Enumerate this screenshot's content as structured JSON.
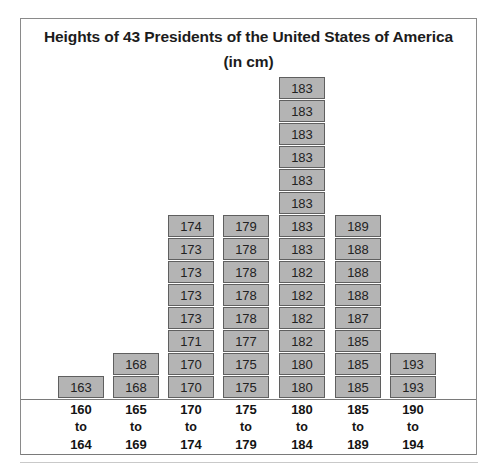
{
  "chart": {
    "title_line1": "Heights of 43 Presidents of the United States of",
    "title_line2": "America (in cm)",
    "connector": "to"
  },
  "chart_data": {
    "type": "bar",
    "title": "Heights of 43 Presidents of the United States of America (in cm)",
    "xlabel": "",
    "ylabel": "",
    "grid": false,
    "legend": "none",
    "note": "Stacked block (stem/dot-plot style) histogram; each block is one president labelled with that president's height in cm.",
    "categories": [
      "160 to 164",
      "165 to 169",
      "170 to 174",
      "175 to 179",
      "180 to 184",
      "185 to 189",
      "190 to 194"
    ],
    "category_lines": [
      {
        "low": "160",
        "mid": "to",
        "high": "164"
      },
      {
        "low": "165",
        "mid": "to",
        "high": "169"
      },
      {
        "low": "170",
        "mid": "to",
        "high": "174"
      },
      {
        "low": "175",
        "mid": "to",
        "high": "179"
      },
      {
        "low": "180",
        "mid": "to",
        "high": "184"
      },
      {
        "low": "185",
        "mid": "to",
        "high": "189"
      },
      {
        "low": "190",
        "mid": "to",
        "high": "194"
      }
    ],
    "values": [
      1,
      2,
      8,
      8,
      14,
      8,
      2
    ],
    "total": 43,
    "ylim": [
      0,
      14
    ],
    "block_labels": [
      [
        "163"
      ],
      [
        "168",
        "168"
      ],
      [
        "170",
        "170",
        "171",
        "173",
        "173",
        "173",
        "173",
        "174"
      ],
      [
        "175",
        "175",
        "177",
        "178",
        "178",
        "178",
        "178",
        "179"
      ],
      [
        "180",
        "180",
        "182",
        "182",
        "182",
        "182",
        "183",
        "183",
        "183",
        "183",
        "183",
        "183",
        "183",
        "183"
      ],
      [
        "185",
        "185",
        "185",
        "187",
        "188",
        "188",
        "188",
        "189"
      ],
      [
        "193",
        "193"
      ]
    ]
  },
  "colors": {
    "block_fill": "#b4b4b4",
    "block_border": "#5f5f5f",
    "frame": "#8a8a8a",
    "text": "#141414",
    "background": "#ffffff"
  }
}
